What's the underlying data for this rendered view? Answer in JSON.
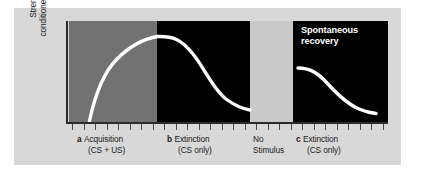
{
  "figure": {
    "background_color": "#d8d8d8",
    "page_color": "#ffffff",
    "axis_color": "#2b2b2b",
    "curve_color": "#ffffff"
  },
  "axes": {
    "y_label_line1": "Strength of",
    "y_label_line2": "conditioned response",
    "tick_count": 28
  },
  "annotations": {
    "spontaneous_recovery_line1": "Spontaneous",
    "spontaneous_recovery_line2": "recovery"
  },
  "phases": [
    {
      "marker": "a",
      "title": "Acquisition",
      "subtitle": "(CS + US)",
      "band_color": "#727272",
      "band_start_pct": 0,
      "band_end_pct": 27.6
    },
    {
      "marker": "b",
      "title": "Extinction",
      "subtitle": "(CS only)",
      "band_color": "#000000",
      "band_start_pct": 27.6,
      "band_end_pct": 56.7
    },
    {
      "marker": "",
      "title": "No",
      "subtitle": "Stimulus",
      "band_color": "#c9c9c9",
      "band_start_pct": 56.7,
      "band_end_pct": 70.2
    },
    {
      "marker": "c",
      "title": "Extinction",
      "subtitle": "(CS only)",
      "band_color": "#000000",
      "band_start_pct": 70.2,
      "band_end_pct": 100
    }
  ],
  "chart_data": {
    "type": "line",
    "title": "",
    "xlabel": "",
    "ylabel": "Strength of conditioned response",
    "xlim": [
      0,
      100
    ],
    "ylim": [
      0,
      100
    ],
    "grid": false,
    "legend": "none",
    "series": [
      {
        "name": "Acquisition",
        "comment": "negatively accelerated rise from floor to asymptote",
        "x": [
          1.5,
          3,
          5,
          7.5,
          10,
          13,
          16,
          19,
          22,
          25,
          27.6
        ],
        "y": [
          0,
          14,
          32,
          48,
          59,
          70,
          77,
          82,
          85,
          87,
          88
        ]
      },
      {
        "name": "Extinction 1",
        "comment": "sigmoid decay to floor",
        "x": [
          27.6,
          31,
          34,
          37,
          40,
          43,
          46,
          49,
          52,
          55,
          56.7
        ],
        "y": [
          88,
          87,
          84,
          77,
          66,
          52,
          38,
          26,
          17,
          12,
          10
        ]
      },
      {
        "name": "Spontaneous recovery / Extinction 2",
        "comment": "partial recovery then decay",
        "x": [
          70.8,
          74,
          77,
          80,
          83,
          86,
          89,
          92,
          95,
          97.5
        ],
        "y": [
          53,
          52,
          49,
          44,
          36,
          28,
          20,
          14,
          10,
          8
        ]
      }
    ]
  }
}
